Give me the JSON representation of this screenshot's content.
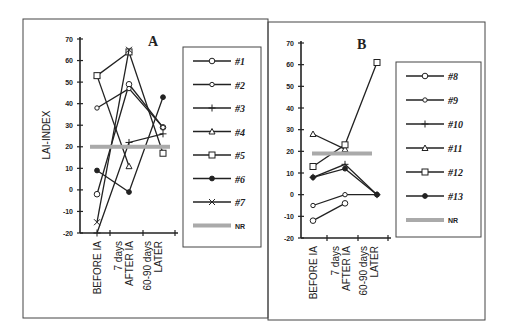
{
  "chart_data": [
    {
      "type": "line",
      "title": "A",
      "ylabel": "LAI-INDEX",
      "xlabel": "",
      "categories": [
        "BEFORE IA",
        "7 days AFTER IA",
        "60-90 days LATER"
      ],
      "ylim": [
        -20,
        70
      ],
      "yticks": [
        70,
        60,
        50,
        40,
        30,
        20,
        10,
        0,
        -10,
        -20
      ],
      "grid": false,
      "legend_position": "right",
      "series": [
        {
          "name": "#1",
          "marker": "circle",
          "values": [
            -2,
            49,
            29
          ]
        },
        {
          "name": "#2",
          "marker": "small-circle",
          "values": [
            38,
            47,
            29
          ]
        },
        {
          "name": "#3",
          "marker": "plus",
          "values": [
            -20,
            22,
            26
          ]
        },
        {
          "name": "#4",
          "marker": "triangle",
          "values": [
            53,
            11,
            null
          ]
        },
        {
          "name": "#5",
          "marker": "square",
          "values": [
            53,
            64,
            17
          ]
        },
        {
          "name": "#6",
          "marker": "filled-circle",
          "values": [
            9,
            -1,
            43
          ]
        },
        {
          "name": "#7",
          "marker": "x",
          "values": [
            -15,
            65,
            null
          ]
        },
        {
          "name": "NR",
          "marker": "band",
          "values": [
            20,
            20,
            20
          ]
        }
      ]
    },
    {
      "type": "line",
      "title": "B",
      "ylabel": "",
      "xlabel": "",
      "categories": [
        "BEFORE IA",
        "7 days AFTER IA",
        "60-90 days LATER"
      ],
      "ylim": [
        -20,
        70
      ],
      "yticks": [
        70,
        60,
        50,
        40,
        30,
        20,
        10,
        0,
        -10,
        -20
      ],
      "grid": false,
      "legend_position": "right",
      "series": [
        {
          "name": "#8",
          "marker": "circle",
          "values": [
            -12,
            -4,
            null
          ]
        },
        {
          "name": "#9",
          "marker": "small-circle",
          "values": [
            -5,
            0,
            0
          ]
        },
        {
          "name": "#10",
          "marker": "plus",
          "values": [
            8,
            14,
            0
          ]
        },
        {
          "name": "#11",
          "marker": "triangle",
          "values": [
            28,
            21,
            null
          ]
        },
        {
          "name": "#12",
          "marker": "square",
          "values": [
            13,
            23,
            61
          ]
        },
        {
          "name": "#13",
          "marker": "filled-circle",
          "values": [
            8,
            12,
            0
          ]
        },
        {
          "name": "NR",
          "marker": "band",
          "values": [
            19,
            19,
            19
          ]
        }
      ]
    }
  ],
  "panels": {
    "a": {
      "title": "A",
      "ylabel": "LAI-INDEX",
      "xlabels": [
        [
          "BEFORE IA"
        ],
        [
          "7 days",
          "AFTER IA"
        ],
        [
          "60-90 days",
          "LATER"
        ]
      ],
      "legend": [
        "#1",
        "#2",
        "#3",
        "#4",
        "#5",
        "#6",
        "#7",
        "NR"
      ]
    },
    "b": {
      "title": "B",
      "xlabels": [
        [
          "BEFORE IA"
        ],
        [
          "7 days",
          "AFTER IA"
        ],
        [
          "60-90 days",
          "LATER"
        ]
      ],
      "legend": [
        "#8",
        "#9",
        "#10",
        "#11",
        "#12",
        "#13",
        "NR"
      ]
    }
  },
  "colors": {
    "ink": "#222222",
    "nr_band": "#aaaaaa",
    "background": "#ffffff"
  }
}
